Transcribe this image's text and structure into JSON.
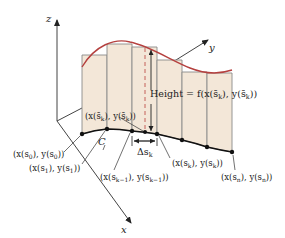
{
  "figure": {
    "colors": {
      "surface_fill": "#f3e7d8",
      "rect_stroke": "#8a8a8a",
      "top_curve": "#b5413f",
      "dashed_line": "#c0504d",
      "base_curve": "#111111",
      "axes": "#333333"
    },
    "axes": {
      "z_label": "z",
      "y_label": "y",
      "x_label": "x"
    },
    "labels": {
      "height": "Height = f(x(s̄k), y(s̄k))",
      "height_prefix": "Height = ",
      "sample_point": "(x(s̄k), y(s̄k))",
      "curve": "C",
      "delta_s": "Δs",
      "delta_s_sub": "k",
      "p0": "(x(s0), y(s0))",
      "p1": "(x(s1), y(s1))",
      "pk_minus_1": "(x(sk−1), y(sk−1))",
      "pk": "(x(sk), y(sk))",
      "pn": "(x(sn), y(sn))"
    },
    "label_parts": {
      "p0": {
        "a": "(x(s",
        "sub": "0",
        "b": "), y(s",
        "sub2": "0",
        "c": "))"
      },
      "p1": {
        "a": "(x(s",
        "sub": "1",
        "b": "), y(s",
        "sub2": "1",
        "c": "))"
      },
      "pkm1": {
        "a": "(x(s",
        "sub": "k−1",
        "b": "), y(s",
        "sub2": "k−1",
        "c": "))"
      },
      "pk": {
        "a": "(x(s",
        "sub": "k",
        "b": "), y(s",
        "sub2": "k",
        "c": "))"
      },
      "pn": {
        "a": "(x(s",
        "sub": "n",
        "b": "), y(s",
        "sub2": "n",
        "c": "))"
      },
      "sample": {
        "a": "(x(s̄",
        "sub": "k",
        "b": "), y(s̄",
        "sub2": "k",
        "c": "))"
      },
      "height": {
        "a": "Height = f(x(s̄",
        "sub": "k",
        "b": "), y(s̄",
        "sub2": "k",
        "c": "))"
      }
    },
    "partition_points": [
      {
        "x": 82,
        "y": 134
      },
      {
        "x": 107,
        "y": 129
      },
      {
        "x": 132,
        "y": 131
      },
      {
        "x": 145,
        "y": 132
      },
      {
        "x": 157,
        "y": 134
      },
      {
        "x": 182,
        "y": 140
      },
      {
        "x": 207,
        "y": 147
      },
      {
        "x": 232,
        "y": 152
      }
    ]
  }
}
